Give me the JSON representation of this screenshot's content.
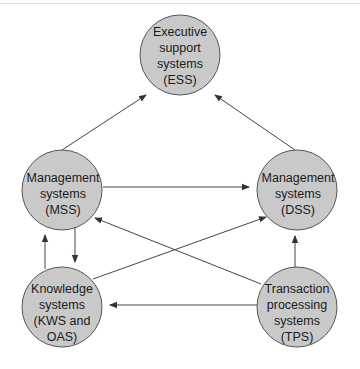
{
  "diagram": {
    "type": "flow",
    "colors": {
      "node_fill": "#c9c9c9",
      "node_stroke": "#555555",
      "edge": "#333333",
      "background": "#ffffff"
    },
    "nodes": [
      {
        "id": "ess",
        "lines": [
          "Executive",
          "support",
          "systems",
          "(ESS)"
        ]
      },
      {
        "id": "mss",
        "lines": [
          "Management",
          "systems",
          "(MSS)"
        ]
      },
      {
        "id": "dss",
        "lines": [
          "Management",
          "systems",
          "(DSS)"
        ]
      },
      {
        "id": "kws",
        "lines": [
          "Knowledge",
          "systems",
          "(KWS and",
          "OAS)"
        ]
      },
      {
        "id": "tps",
        "lines": [
          "Transaction",
          "processing",
          "systems",
          "(TPS)"
        ]
      }
    ],
    "edges": [
      {
        "from": "mss",
        "to": "ess"
      },
      {
        "from": "dss",
        "to": "ess"
      },
      {
        "from": "mss",
        "to": "dss"
      },
      {
        "from": "mss",
        "to": "kws"
      },
      {
        "from": "kws",
        "to": "mss"
      },
      {
        "from": "kws",
        "to": "dss"
      },
      {
        "from": "tps",
        "to": "mss"
      },
      {
        "from": "tps",
        "to": "kws"
      },
      {
        "from": "tps",
        "to": "dss"
      }
    ]
  }
}
